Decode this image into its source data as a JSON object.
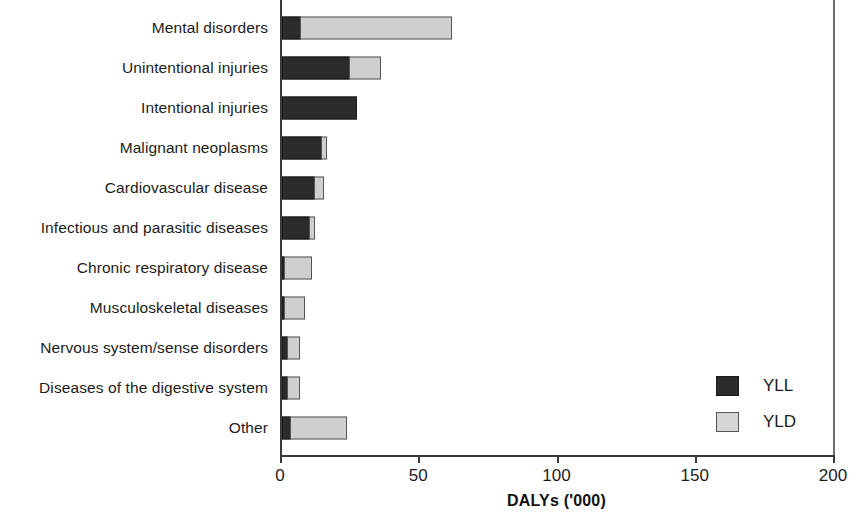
{
  "chart_data": {
    "type": "bar",
    "orientation": "horizontal",
    "stacked": true,
    "title": "",
    "xlabel": "DALYs ('000)",
    "ylabel": "",
    "xlim": [
      0,
      200
    ],
    "xticks": [
      "0",
      "50",
      "100",
      "150",
      "200"
    ],
    "grid": false,
    "legend_position": "lower-right-inside",
    "categories": [
      "Mental disorders",
      "Unintentional injuries",
      "Intentional injuries",
      "Malignant neoplasms",
      "Cardiovascular disease",
      "Infectious and parasitic diseases",
      "Chronic respiratory disease",
      "Musculoskeletal diseases",
      "Nervous system/sense disorders",
      "Diseases of the digestive system",
      "Other"
    ],
    "series": [
      {
        "name": "YLL",
        "color": "#2b2b2b",
        "values": [
          7,
          24.5,
          27,
          14.5,
          12,
          10,
          1,
          0.6,
          2,
          2.2,
          3.2
        ]
      },
      {
        "name": "YLD",
        "color": "#cfcfcf",
        "values": [
          55,
          11.5,
          0,
          2,
          3.5,
          2.2,
          10,
          7.6,
          5,
          4.8,
          20.8
        ]
      }
    ],
    "totals": [
      62,
      36,
      27,
      16.5,
      15.5,
      12.2,
      11,
      8.2,
      7,
      7,
      24
    ]
  },
  "legend": {
    "items": [
      {
        "label": "YLL",
        "swatch": "dark-square-icon"
      },
      {
        "label": "YLD",
        "swatch": "light-square-icon"
      }
    ]
  }
}
